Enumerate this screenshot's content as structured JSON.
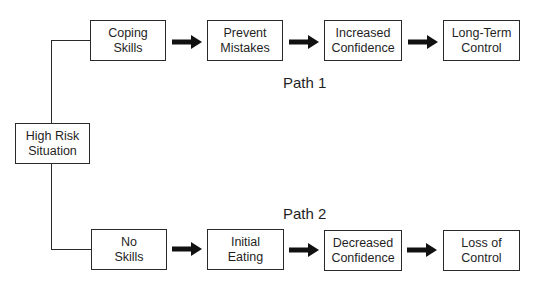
{
  "diagram": {
    "root": {
      "label_line1": "High Risk",
      "label_line2": "Situation"
    },
    "paths": [
      {
        "label": "Path 1",
        "steps": [
          {
            "line1": "Coping",
            "line2": "Skills"
          },
          {
            "line1": "Prevent",
            "line2": "Mistakes"
          },
          {
            "line1": "Increased",
            "line2": "Confidence"
          },
          {
            "line1": "Long-Term",
            "line2": "Control"
          }
        ]
      },
      {
        "label": "Path 2",
        "steps": [
          {
            "line1": "No",
            "line2": "Skills"
          },
          {
            "line1": "Initial",
            "line2": "Eating"
          },
          {
            "line1": "Decreased",
            "line2": "Confidence"
          },
          {
            "line1": "Loss of",
            "line2": "Control"
          }
        ]
      }
    ],
    "colors": {
      "stroke": "#2a2a2a",
      "arrow": "#111111",
      "background": "#ffffff",
      "text": "#1f1f1f"
    },
    "icons": {
      "arrow": "right-arrow-icon"
    }
  }
}
